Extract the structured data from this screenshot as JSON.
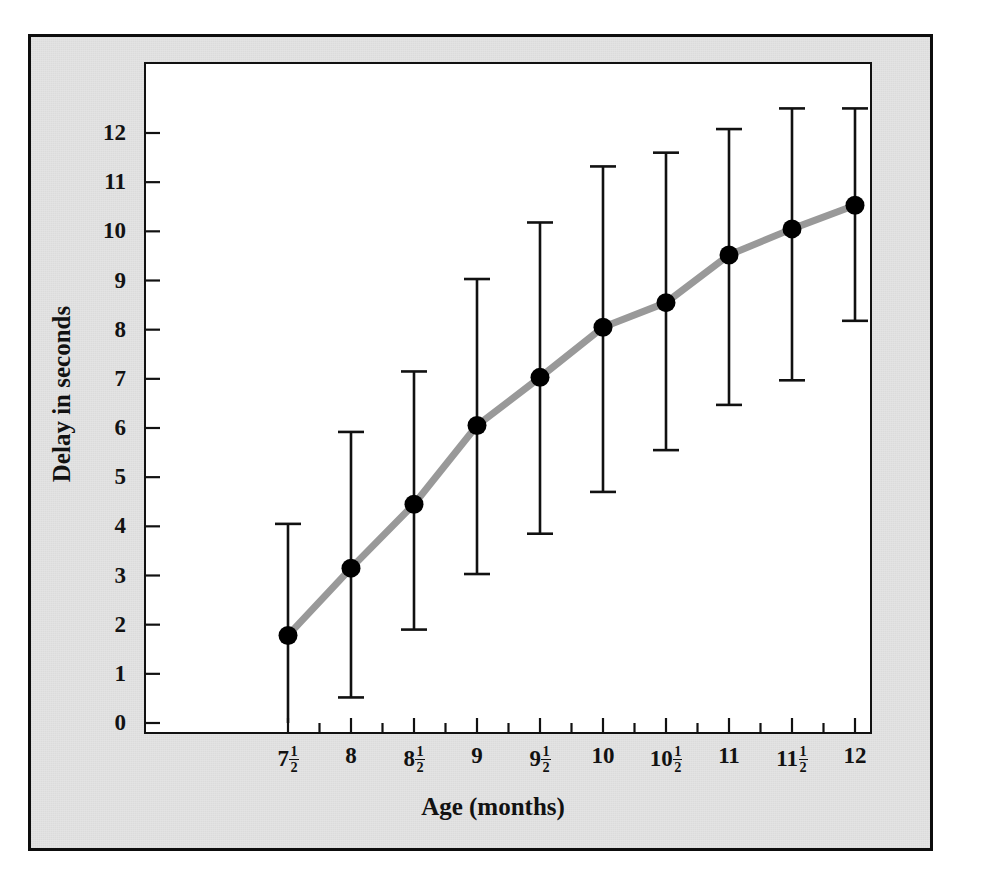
{
  "figure": {
    "background_color": "#e3e3e3",
    "plot_background_color": "#ffffff",
    "frame_color": "#0d0d0d",
    "line_color": "#999999",
    "marker_color": "#000000",
    "errorbar_color": "#111111"
  },
  "chart_data": {
    "type": "line",
    "title": "",
    "subtitle": "",
    "xlabel": "Age (months)",
    "ylabel": "Delay in seconds",
    "grid": false,
    "legend": "none",
    "xlim": [
      7.25,
      12.25
    ],
    "ylim": [
      0,
      12.6
    ],
    "ytick_values": [
      0,
      1,
      2,
      3,
      4,
      5,
      6,
      7,
      8,
      9,
      10,
      11,
      12
    ],
    "ytick_labels": [
      "0",
      "1",
      "2",
      "3",
      "4",
      "5",
      "6",
      "7",
      "8",
      "9",
      "10",
      "11",
      "12"
    ],
    "xtick_values": [
      7.5,
      8,
      8.5,
      9,
      9.5,
      10,
      10.5,
      11,
      11.5,
      12
    ],
    "xtick_labels": [
      {
        "whole": "7",
        "num": "1",
        "den": "2"
      },
      {
        "whole": "8",
        "num": "",
        "den": ""
      },
      {
        "whole": "8",
        "num": "1",
        "den": "2"
      },
      {
        "whole": "9",
        "num": "",
        "den": ""
      },
      {
        "whole": "9",
        "num": "1",
        "den": "2"
      },
      {
        "whole": "10",
        "num": "",
        "den": ""
      },
      {
        "whole": "10",
        "num": "1",
        "den": "2"
      },
      {
        "whole": "11",
        "num": "",
        "den": ""
      },
      {
        "whole": "11",
        "num": "1",
        "den": "2"
      },
      {
        "whole": "12",
        "num": "",
        "den": ""
      }
    ],
    "x": [
      7.5,
      8,
      8.5,
      9,
      9.5,
      10,
      10.5,
      11,
      11.5,
      12
    ],
    "values": [
      1.78,
      3.15,
      4.45,
      6.05,
      7.03,
      8.05,
      8.55,
      9.52,
      10.05,
      10.53
    ],
    "error_upper": [
      4.05,
      5.92,
      7.15,
      9.03,
      10.18,
      11.32,
      11.6,
      12.08,
      12.5,
      12.5
    ],
    "error_lower": [
      0.0,
      0.52,
      1.9,
      3.03,
      3.85,
      4.7,
      5.55,
      6.47,
      6.97,
      8.18
    ],
    "series": [
      {
        "name": "Mean delay",
        "values": [
          1.78,
          3.15,
          4.45,
          6.05,
          7.03,
          8.05,
          8.55,
          9.52,
          10.05,
          10.53
        ]
      }
    ]
  }
}
